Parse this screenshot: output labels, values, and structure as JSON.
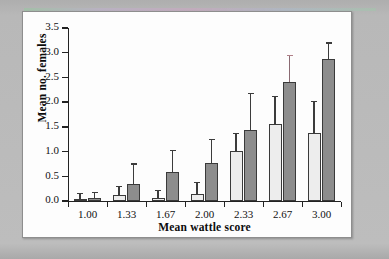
{
  "figure": {
    "background_color": "#b3b3b3",
    "plot_background_color": "#fdfdfd",
    "light_bar_color": "#ededed",
    "dark_bar_color": "#8d8d8d",
    "axis_color": "#222222"
  },
  "chart_data": {
    "type": "bar",
    "title": "",
    "xlabel": "Mean wattle score",
    "ylabel": "Mean no. females",
    "categories": [
      "1.00",
      "1.33",
      "1.67",
      "2.00",
      "2.33",
      "2.67",
      "3.00"
    ],
    "ylim": [
      0.0,
      3.5
    ],
    "ytick_labels": [
      "0.0",
      "0.5",
      "1.0",
      "1.5",
      "2.0",
      "2.5",
      "3.0",
      "3.5"
    ],
    "ytick_values": [
      0.0,
      0.5,
      1.0,
      1.5,
      2.0,
      2.5,
      3.0,
      3.5
    ],
    "grid": false,
    "legend": "none",
    "error_bars": "upper only",
    "series": [
      {
        "name": "light",
        "color": "#ededed",
        "values": [
          0.05,
          0.12,
          0.07,
          0.15,
          1.02,
          1.55,
          1.38
        ],
        "error_upper": [
          0.16,
          0.31,
          0.22,
          0.38,
          1.38,
          2.13,
          2.03
        ]
      },
      {
        "name": "dark",
        "color": "#8d8d8d",
        "values": [
          0.07,
          0.34,
          0.58,
          0.77,
          1.43,
          2.41,
          2.87
        ],
        "error_upper": [
          0.18,
          0.76,
          1.03,
          1.26,
          2.19,
          2.95,
          3.21
        ]
      }
    ]
  }
}
